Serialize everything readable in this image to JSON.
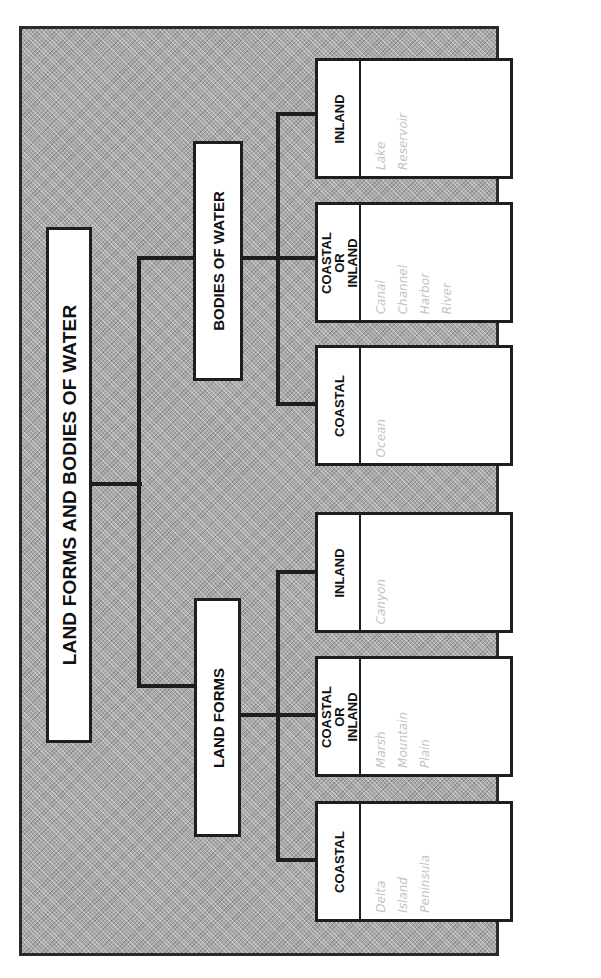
{
  "page_header": "",
  "diagram": {
    "title": "LAND FORMS AND BODIES OF WATER",
    "branches": [
      {
        "label": "LAND FORMS",
        "categories": [
          {
            "label": "COASTAL",
            "items": [
              "Delta",
              "Island",
              "Peninsula"
            ]
          },
          {
            "label": "COASTAL OR INLAND",
            "items": [
              "Marsh",
              "Mountain",
              "Plain"
            ]
          },
          {
            "label": "INLAND",
            "items": [
              "Canyon"
            ]
          }
        ]
      },
      {
        "label": "BODIES OF WATER",
        "categories": [
          {
            "label": "COASTAL",
            "items": [
              "Ocean"
            ]
          },
          {
            "label": "COASTAL OR INLAND",
            "items": [
              "Canal",
              "Channel",
              "Harbor",
              "River"
            ]
          },
          {
            "label": "INLAND",
            "items": [
              "Lake",
              "Reservoir"
            ]
          }
        ]
      }
    ]
  },
  "colors": {
    "frame_fill": "#a9a9a9",
    "line": "#1e1e1e",
    "box_fill": "#ffffff",
    "item_text": "#c4c4c4"
  }
}
